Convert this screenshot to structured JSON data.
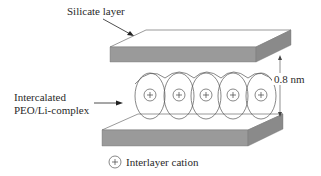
{
  "diagram": {
    "labels": {
      "silicate_layer": "Silicate layer",
      "intercalated_line1": "Intercalated",
      "intercalated_line2": "PEO/Li-complex",
      "spacing": "0.8 nm",
      "legend_cation": "Interlayer cation",
      "cation_symbol": "+"
    },
    "colors": {
      "plate_front": "#9a9a9a",
      "plate_side": "#8a8a8a",
      "plate_top": "#ffffff",
      "line": "#3a3a3a"
    },
    "cations": [
      {
        "x": 150,
        "y": 95
      },
      {
        "x": 179,
        "y": 95
      },
      {
        "x": 206,
        "y": 95
      },
      {
        "x": 233,
        "y": 95
      },
      {
        "x": 261,
        "y": 95
      }
    ]
  }
}
